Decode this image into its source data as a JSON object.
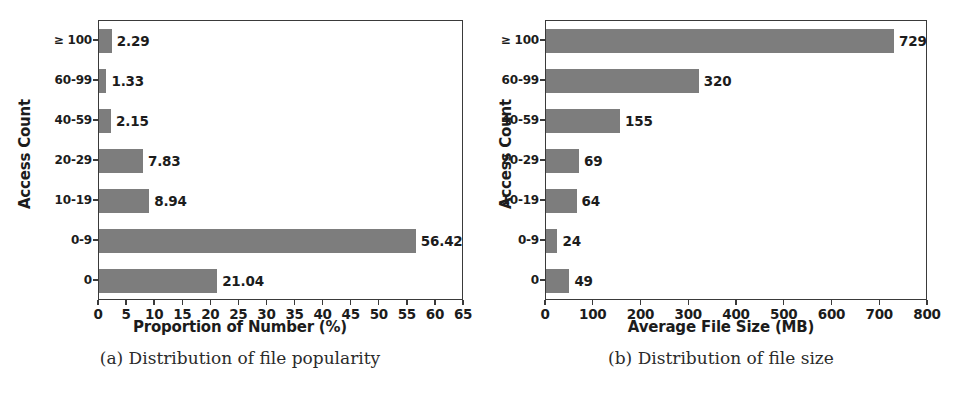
{
  "figure": {
    "bar_color": "#7d7d7d",
    "axis_color": "#3a3a3a",
    "text_color": "#1c1c1c"
  },
  "panels": [
    {
      "id": "panel-a",
      "caption": "(a) Distribution of file popularity",
      "chart_data": {
        "type": "bar",
        "orientation": "horizontal",
        "title": "",
        "xlabel": "Proportion of Number (%)",
        "ylabel": "Access Count",
        "categories": [
          "0",
          "0-9",
          "10-19",
          "20-29",
          "40-59",
          "60-99",
          "≥ 100"
        ],
        "values": [
          21.04,
          56.42,
          8.94,
          7.83,
          2.15,
          1.33,
          2.29
        ],
        "data_labels": [
          "21.04",
          "56.42",
          "8.94",
          "7.83",
          "2.15",
          "1.33",
          "2.29"
        ],
        "xlim": [
          0,
          65
        ],
        "ylim": [
          -0.5,
          6.5
        ],
        "xticks": [
          0,
          5,
          10,
          15,
          20,
          25,
          30,
          35,
          40,
          45,
          50,
          55,
          60,
          65
        ],
        "xticklabels": [
          "0",
          "5",
          "10",
          "15",
          "20",
          "25",
          "30",
          "35",
          "40",
          "45",
          "50",
          "55",
          "60",
          "65"
        ],
        "grid": false,
        "legend": false
      }
    },
    {
      "id": "panel-b",
      "caption": "(b) Distribution of file size",
      "chart_data": {
        "type": "bar",
        "orientation": "horizontal",
        "title": "",
        "xlabel": "Average File Size (MB)",
        "ylabel": "Access Count",
        "categories": [
          "0",
          "0-9",
          "10-19",
          "20-29",
          "40-59",
          "60-99",
          "≥ 100"
        ],
        "values": [
          49,
          24,
          64,
          69,
          155,
          320,
          729
        ],
        "data_labels": [
          "49",
          "24",
          "64",
          "69",
          "155",
          "320",
          "729"
        ],
        "xlim": [
          0,
          800
        ],
        "ylim": [
          -0.5,
          6.5
        ],
        "xticks": [
          0,
          100,
          200,
          300,
          400,
          500,
          600,
          700,
          800
        ],
        "xticklabels": [
          "0",
          "100",
          "200",
          "300",
          "400",
          "500",
          "600",
          "700",
          "800"
        ],
        "grid": false,
        "legend": false
      }
    }
  ]
}
